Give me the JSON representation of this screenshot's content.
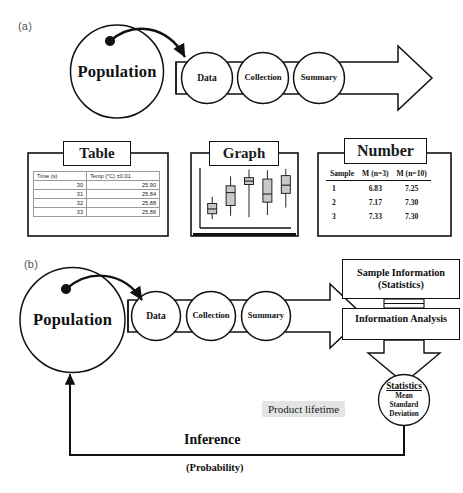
{
  "figure": {
    "panel_a_label": "(a)",
    "panel_b_label": "(b)"
  },
  "flow": {
    "population": "Population",
    "data": "Data",
    "collection": "Collection",
    "summary": "Summary"
  },
  "panel_a": {
    "table_card": {
      "title": "Table",
      "columns": [
        "Time (s)",
        "Temp (°C) ±0.01"
      ],
      "rows": [
        [
          "30",
          "25.90"
        ],
        [
          "31",
          "25.84"
        ],
        [
          "32",
          "25.88"
        ],
        [
          "33",
          "25.86"
        ]
      ]
    },
    "graph_card": {
      "title": "Graph"
    },
    "number_card": {
      "title": "Number",
      "columns": [
        "Sample",
        "M (n=3)",
        "M (n=10)"
      ],
      "rows": [
        [
          "1",
          "6.83",
          "7.25"
        ],
        [
          "2",
          "7.17",
          "7.30"
        ],
        [
          "3",
          "7.33",
          "7.30"
        ]
      ]
    }
  },
  "panel_b": {
    "sample_information": "Sample Information\n(Statistics)",
    "sample_information_line1": "Sample Information",
    "sample_information_line2": "(Statistics)",
    "information_analysis": "Information Analysis",
    "statistics_circle": {
      "title": "Statistics",
      "lines": [
        "Mean",
        "Standard",
        "Deviation"
      ]
    },
    "product_lifetime": "Product lifetime",
    "inference": "Inference",
    "probability": "(Probability)"
  },
  "chart_data": {
    "type": "boxplot",
    "title": "Graph",
    "xlabel": "",
    "ylabel": "",
    "categories": [
      "1",
      "2",
      "3",
      "4",
      "5"
    ],
    "grid": false,
    "legend": "none",
    "ylim": [
      0,
      10
    ],
    "boxes": [
      {
        "category": "1",
        "whisker_low": 1.3,
        "q1": 2.1,
        "median": 2.8,
        "q3": 3.6,
        "whisker_high": 4.6
      },
      {
        "category": "2",
        "whisker_low": 1.8,
        "q1": 3.3,
        "median": 5.2,
        "q3": 6.2,
        "whisker_high": 7.6
      },
      {
        "category": "3",
        "whisker_low": 1.6,
        "q1": 6.4,
        "median": 6.9,
        "q3": 7.4,
        "whisker_high": 8.6
      },
      {
        "category": "4",
        "whisker_low": 1.9,
        "q1": 3.8,
        "median": 5.0,
        "q3": 7.2,
        "whisker_high": 8.5
      },
      {
        "category": "5",
        "whisker_low": 3.0,
        "q1": 5.1,
        "median": 6.3,
        "q3": 7.7,
        "whisker_high": 8.7
      }
    ]
  },
  "colors": {
    "stroke": "#111111",
    "box_fill": "#c9c9c9",
    "highlight_bg": "#e4e4e4",
    "page_bg": "#ffffff"
  }
}
